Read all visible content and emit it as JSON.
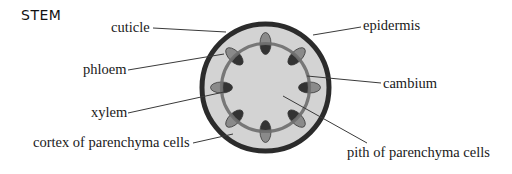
{
  "title": "STEM",
  "colors": {
    "background": "#ffffff",
    "epidermis": "#2b2b2b",
    "cortex_fill": "#d3d3d3",
    "pith_fill": "#d3d3d3",
    "cambium": "#6f6f6f",
    "xylem": "#333333",
    "phloem": "#8a8a8a",
    "leader_line": "#3a3a3a"
  },
  "labels": {
    "cuticle": "cuticle",
    "phloem": "phloem",
    "xylem": "xylem",
    "cortex": "cortex of parenchyma cells",
    "epidermis": "epidermis",
    "cambium": "cambium",
    "pith": "pith of parenchyma cells"
  },
  "structure": {
    "vascular_bundle_count": 8
  }
}
